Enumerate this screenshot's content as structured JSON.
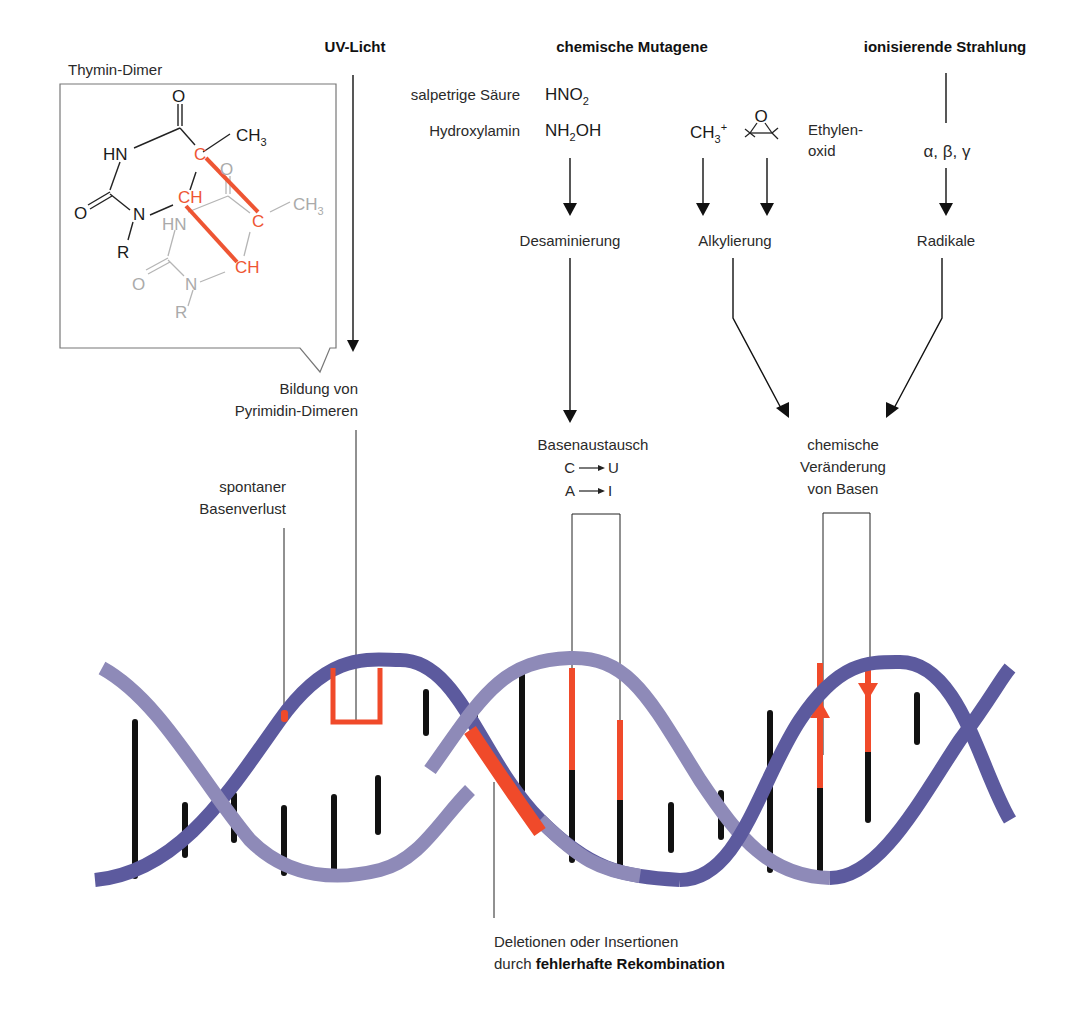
{
  "headers": {
    "uv": "UV-Licht",
    "chem": "chemische Mutagene",
    "ion": "ionisierende Strahlung"
  },
  "thymin_dimer": {
    "title": "Thymin-Dimer",
    "atoms": {
      "o_top": "O",
      "hn": "HN",
      "c_red": "C",
      "ch3": "CH",
      "ch3_sub": "3",
      "o_left": "O",
      "n": "N",
      "ch_red": "CH",
      "r": "R",
      "o_gray": "O",
      "hn_gray": "HN",
      "c_red2": "C",
      "ch3_gray": "CH",
      "ch3_gray_sub": "3",
      "ch_red2": "CH",
      "o_gray2": "O",
      "n_gray": "N",
      "r_gray": "R"
    }
  },
  "uv_result": {
    "line1": "Bildung von",
    "line2": "Pyrimidin-Dimeren"
  },
  "mutagens": {
    "salpetrige_label": "salpetrige Säure",
    "salpetrige_formula": "HNO",
    "salpetrige_sub": "2",
    "hydroxylamin_label": "Hydroxylamin",
    "hydroxylamin_formula_a": "NH",
    "hydroxylamin_sub": "2",
    "hydroxylamin_formula_b": "OH",
    "methyl": "CH",
    "methyl_sub": "3",
    "methyl_sup": "+",
    "epoxide_o": "O",
    "ethylenoxid_line1": "Ethylen-",
    "ethylenoxid_line2": "oxid"
  },
  "radiation": {
    "types": "α, β, γ"
  },
  "processes": {
    "desaminierung": "Desaminierung",
    "alkylierung": "Alkylierung",
    "radikale": "Radikale"
  },
  "results": {
    "basenaustausch": "Basenaustausch",
    "cu_from": "C",
    "cu_to": "U",
    "ai_from": "A",
    "ai_to": "I",
    "chem_change_line1": "chemische",
    "chem_change_line2": "Veränderung",
    "chem_change_line3": "von Basen",
    "spontan_line1": "spontaner",
    "spontan_line2": "Basenverlust"
  },
  "bottom": {
    "line1": "Deletionen oder Insertionen",
    "line2_prefix": "durch ",
    "line2_bold": "fehlerhafte Rekombination"
  },
  "colors": {
    "strand_light": "#8e8ab8",
    "strand_dark": "#5c5a9e",
    "mutation_red": "#f04a2a",
    "base_black": "#111111"
  }
}
